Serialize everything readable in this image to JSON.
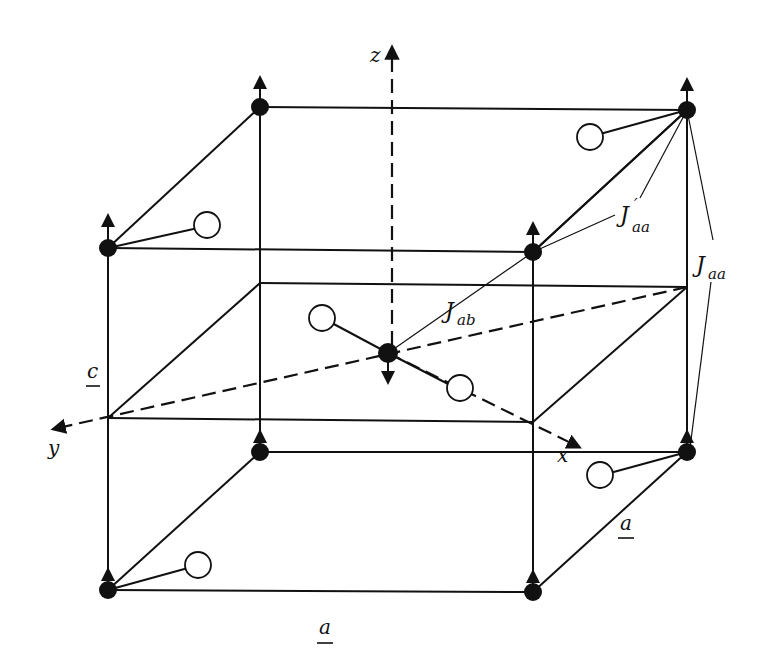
{
  "figure": {
    "type": "crystal-structure-diagram"
  },
  "axes": {
    "x": "x",
    "y": "y",
    "z": "z"
  },
  "lattice_labels": {
    "a_bottom": "a",
    "a_side": "a",
    "c": "c"
  },
  "exchange_labels": {
    "J_ab": {
      "main": "J",
      "sub": "ab",
      "prime": ""
    },
    "J_aa_prime": {
      "main": "J",
      "sub": "aa",
      "prime": "′"
    },
    "J_aa": {
      "main": "J",
      "sub": "aa",
      "prime": ""
    }
  },
  "colors": {
    "ink": "#111111",
    "background": "#ffffff",
    "ligand_fill": "#ffffff"
  },
  "atoms": {
    "corner_spin_up": 8,
    "center_spin_down": 1,
    "ligands": 6
  }
}
